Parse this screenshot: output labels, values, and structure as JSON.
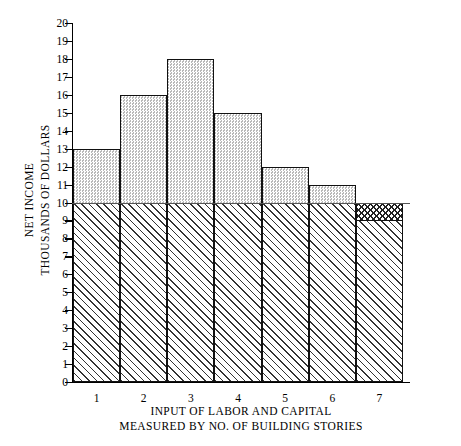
{
  "chart_data": {
    "type": "bar",
    "title": "",
    "xlabel": "INPUT OF LABOR AND CAPITAL MEASURED BY NO. OF BUILDING STORIES",
    "xlabel_lines": [
      "INPUT OF LABOR AND CAPITAL",
      "MEASURED BY NO. OF BUILDING STORIES"
    ],
    "ylabel": "NET INCOME THOUSANDS OF DOLLARS",
    "ylabel_lines": [
      "NET INCOME",
      "THOUSANDS OF DOLLARS"
    ],
    "categories": [
      "1",
      "2",
      "3",
      "4",
      "5",
      "6",
      "7"
    ],
    "values": [
      13,
      16,
      18,
      15,
      12,
      11,
      9
    ],
    "ylim": [
      0,
      20
    ],
    "ytick_labels": [
      "0",
      "1",
      "2",
      "3",
      "4",
      "5",
      "6",
      "7",
      "8",
      "9",
      "10",
      "11",
      "12",
      "13",
      "14",
      "15",
      "16",
      "17",
      "18",
      "19",
      "20"
    ],
    "ytick_values": [
      0,
      1,
      2,
      3,
      4,
      5,
      6,
      7,
      8,
      9,
      10,
      11,
      12,
      13,
      14,
      15,
      16,
      17,
      18,
      19,
      20
    ],
    "xtick_labels": [
      "1",
      "2",
      "3",
      "4",
      "5",
      "6",
      "7"
    ],
    "grid": false,
    "legend": "none",
    "reference_line_value": 10,
    "annotations": [
      {
        "category": "7",
        "note": "value 9 falls below the 10 reference line; region from 9 to 10 is cross-hatched"
      }
    ],
    "series_fill_above_reference": "stipple",
    "series_fill_below_reference": "diagonal-hatch",
    "accent_color": "#000000",
    "stipple_color": "#d8d8d8",
    "hatch_color": "#333333"
  }
}
